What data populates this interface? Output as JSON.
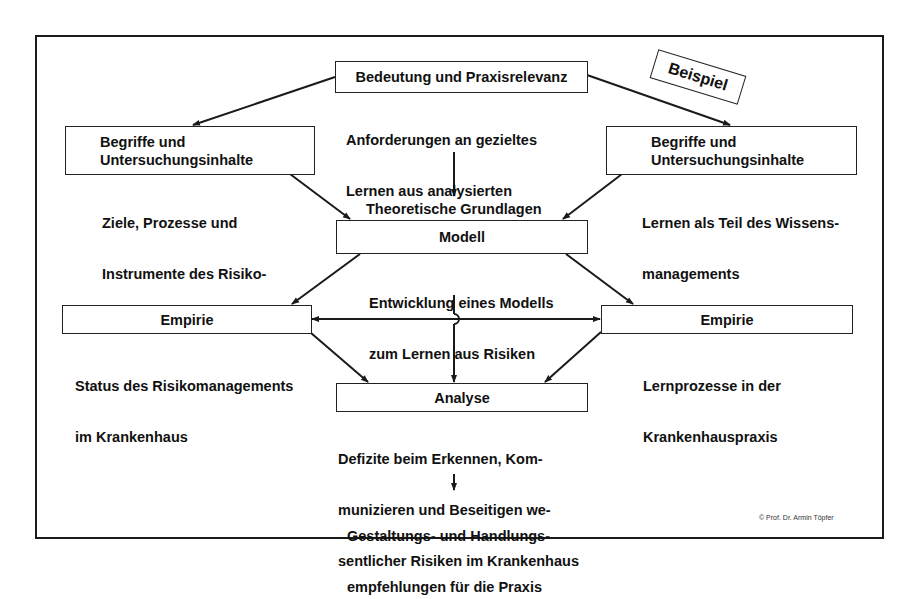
{
  "diagram": {
    "top": {
      "box_label": "Bedeutung und Praxisrelevanz",
      "description": [
        "Anforderungen an gezieltes",
        "Lernen aus analysierten",
        "Risiken im Krankenhaus"
      ]
    },
    "stamp_label": "Beispiel",
    "left_concepts": {
      "box_lines": [
        "Begriffe und",
        "Untersuchungsinhalte"
      ],
      "description": [
        "Ziele, Prozesse und",
        "Instrumente des Risiko-",
        "managements"
      ]
    },
    "right_concepts": {
      "box_lines": [
        "Begriffe und",
        "Untersuchungsinhalte"
      ],
      "description": [
        "Lernen als Teil des Wissens-",
        "managements"
      ]
    },
    "model": {
      "caption_above": "Theoretische Grundlagen",
      "box_label": "Modell",
      "description": [
        "Entwicklung eines Modells",
        "zum Lernen aus Risiken"
      ]
    },
    "left_empirics": {
      "box_label": "Empirie",
      "description": [
        "Status des Risikomanagements",
        "im Krankenhaus"
      ]
    },
    "right_empirics": {
      "box_label": "Empirie",
      "description": [
        "Lernprozesse in der",
        "Krankenhauspraxis"
      ]
    },
    "analysis": {
      "box_label": "Analyse",
      "description": [
        "Defizite beim Erkennen, Kom-",
        "munizieren und Beseitigen we-",
        "sentlicher Risiken im Krankenhaus"
      ]
    },
    "outcome": [
      "Gestaltungs- und Handlungs-",
      "empfehlungen für die Praxis"
    ],
    "copyright": "© Prof. Dr. Armin Töpfer"
  },
  "colors": {
    "line": "#1a1a1a",
    "background": "#ffffff",
    "text": "#111111"
  }
}
